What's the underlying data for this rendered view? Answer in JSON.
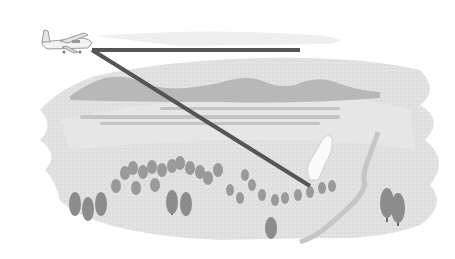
{
  "scene": {
    "description": "Grayscale illustration of a small aircraft flying over a forested valley, with a horizontal sight line and a diagonal line pointing down to a smoke plume in the forest",
    "colors": {
      "background": "#ffffff",
      "ground": "#dcdcdc",
      "ground_light": "#e8e8e8",
      "hills": "#b4b4b4",
      "trees": "#8c8c8c",
      "tree_trunk": "#6a6a6a",
      "lines": "#555555",
      "smoke": "#f8f8f8",
      "river": "#cfcfcf"
    },
    "aircraft": {
      "icon": "airplane-icon",
      "x": 62,
      "y": 44
    },
    "horizontal_line": {
      "x1": 92,
      "y1": 50,
      "x2": 300,
      "y2": 50
    },
    "diagonal_line": {
      "x1": 92,
      "y1": 50,
      "x2": 310,
      "y2": 185
    },
    "smoke_plume": {
      "icon": "smoke-icon",
      "x": 320,
      "y": 165
    }
  }
}
